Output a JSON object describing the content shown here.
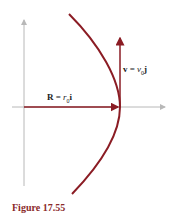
{
  "figure": {
    "caption": "Figure 17.55",
    "colors": {
      "curve": "#8b1c24",
      "axis": "#b8b8b8",
      "caption": "#8b2a2a"
    },
    "labels": {
      "velocity": {
        "lhs": "v",
        "eq": " = ",
        "var": "v",
        "sub": "0",
        "unit": "j"
      },
      "position": {
        "lhs": "R",
        "eq": " = ",
        "var": "r",
        "sub": "0",
        "unit": "i"
      }
    }
  }
}
